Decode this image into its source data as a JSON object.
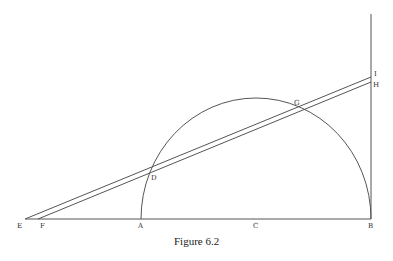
{
  "caption": "Figure 6.2",
  "points": {
    "E": {
      "label": "E",
      "x": 25,
      "y": 219
    },
    "F": {
      "label": "F",
      "x": 38,
      "y": 219
    },
    "A": {
      "label": "A",
      "x": 141,
      "y": 219
    },
    "C": {
      "label": "C",
      "x": 256,
      "y": 219
    },
    "B": {
      "label": "B",
      "x": 371,
      "y": 219
    },
    "D": {
      "label": "D",
      "x": 148,
      "y": 172
    },
    "G": {
      "label": "G",
      "x": 294,
      "y": 99
    },
    "I": {
      "label": "I",
      "x": 371,
      "y": 77
    },
    "H": {
      "label": "H",
      "x": 371,
      "y": 82
    }
  },
  "colors": {
    "line": "#555555",
    "text": "#333333"
  }
}
